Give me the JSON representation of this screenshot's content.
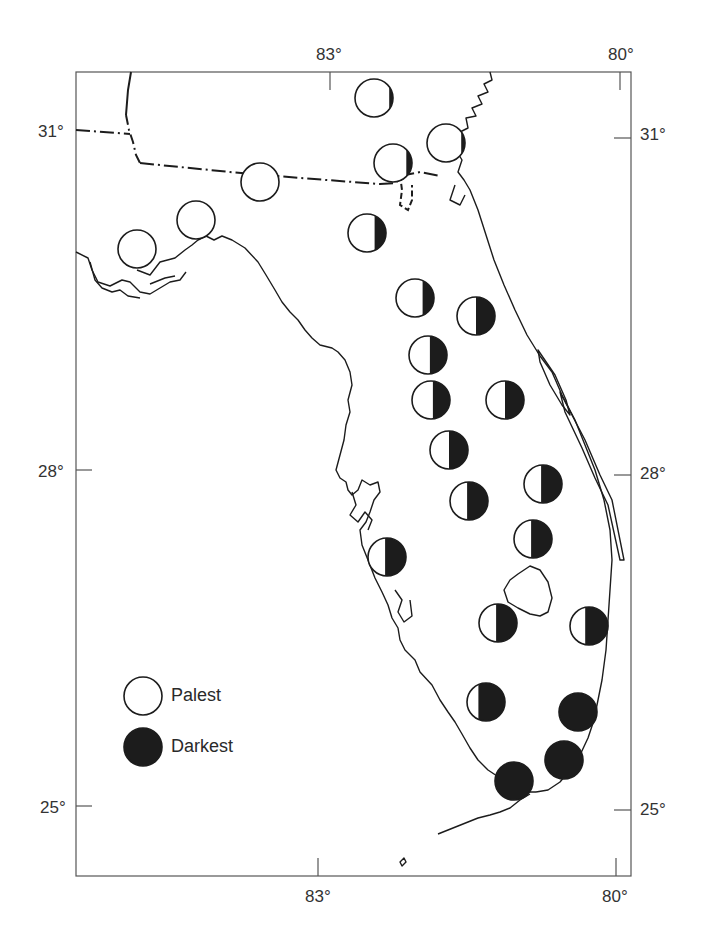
{
  "map": {
    "frame": {
      "x": 76,
      "y": 72,
      "w": 555,
      "h": 804
    },
    "axes": {
      "top_labels": [
        {
          "text": "83°",
          "x": 333,
          "y": 56
        },
        {
          "text": "80°",
          "x": 625,
          "y": 56
        }
      ],
      "bottom_labels": [
        {
          "text": "83°",
          "x": 316,
          "y": 904
        },
        {
          "text": "80°",
          "x": 616,
          "y": 904
        }
      ],
      "left_labels": [
        {
          "text": "31°",
          "x": 40,
          "y": 136
        },
        {
          "text": "28°",
          "x": 40,
          "y": 478
        },
        {
          "text": "25°",
          "x": 42,
          "y": 812
        }
      ],
      "right_labels": [
        {
          "text": "31°",
          "x": 640,
          "y": 140
        },
        {
          "text": "28°",
          "x": 640,
          "y": 480
        },
        {
          "text": "25°",
          "x": 640,
          "y": 813
        }
      ]
    },
    "legend": {
      "palest_label": "Palest",
      "darkest_label": "Darkest"
    },
    "colors": {
      "ink": "#1c1c1c",
      "frame": "#555555",
      "paper": "#ffffff"
    },
    "stations": [
      {
        "cx": 374,
        "cy": 98,
        "dark": 0.1
      },
      {
        "cx": 446,
        "cy": 143,
        "dark": 0.1
      },
      {
        "cx": 393,
        "cy": 163,
        "dark": 0.15
      },
      {
        "cx": 260,
        "cy": 182,
        "dark": 0.0
      },
      {
        "cx": 196,
        "cy": 220,
        "dark": 0.0
      },
      {
        "cx": 137,
        "cy": 249,
        "dark": 0.0
      },
      {
        "cx": 367,
        "cy": 233,
        "dark": 0.3
      },
      {
        "cx": 415,
        "cy": 298,
        "dark": 0.3
      },
      {
        "cx": 476,
        "cy": 316,
        "dark": 0.5
      },
      {
        "cx": 428,
        "cy": 355,
        "dark": 0.45
      },
      {
        "cx": 431,
        "cy": 400,
        "dark": 0.45
      },
      {
        "cx": 505,
        "cy": 400,
        "dark": 0.5
      },
      {
        "cx": 449,
        "cy": 450,
        "dark": 0.5
      },
      {
        "cx": 469,
        "cy": 501,
        "dark": 0.55
      },
      {
        "cx": 543,
        "cy": 484,
        "dark": 0.55
      },
      {
        "cx": 533,
        "cy": 539,
        "dark": 0.55
      },
      {
        "cx": 387,
        "cy": 557,
        "dark": 0.55
      },
      {
        "cx": 498,
        "cy": 623,
        "dark": 0.55
      },
      {
        "cx": 589,
        "cy": 626,
        "dark": 0.6
      },
      {
        "cx": 486,
        "cy": 702,
        "dark": 0.7
      },
      {
        "cx": 578,
        "cy": 712,
        "dark": 1.0
      },
      {
        "cx": 564,
        "cy": 760,
        "dark": 1.0
      },
      {
        "cx": 514,
        "cy": 781,
        "dark": 1.0
      }
    ]
  }
}
